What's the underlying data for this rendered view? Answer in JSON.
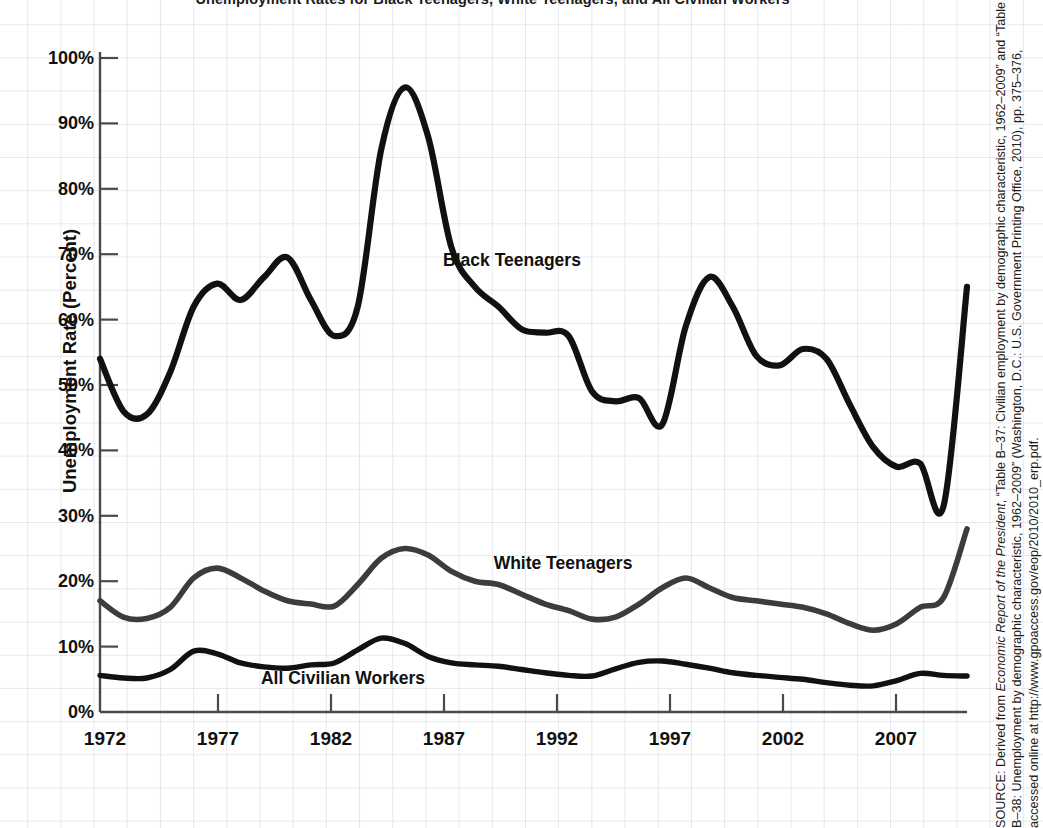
{
  "figure": {
    "title_cropped": "Unemployment Rates for Black Teenagers, White Teenagers, and All Civilian Workers",
    "source_prefix": "SOURCE: Derived from ",
    "source_italic_1": "Economic Report of the President",
    "source_mid_1": ", “Table B–37: Civilian employment by demographic characteristic, 1962–2009” and “Table B–38: Unemployment by demographic characteristic, 1962–2009” (Washington, D.C.: U.S. Government Printing Office, 2010), pp. 375–376, accessed online at http://www.gpoaccess.gov/eop/2010/2010_erp.pdf."
  },
  "axes": {
    "ylabel": "Unemployment Rate (Percent)",
    "xlabel": "",
    "yticks": [
      "0%",
      "10%",
      "20%",
      "30%",
      "40%",
      "50%",
      "60%",
      "70%",
      "80%",
      "90%",
      "100%"
    ],
    "xticks": [
      "1972",
      "1977",
      "1982",
      "1987",
      "1992",
      "1997",
      "2002",
      "2007"
    ]
  },
  "colors": {
    "black_series": "#111111",
    "gray_series": "#3c3c3c",
    "axis": "#4a4a4a",
    "grid": "#acb7c4",
    "text": "#111111"
  },
  "chart_data": {
    "type": "line",
    "title": "Unemployment Rates for Black Teenagers, White Teenagers, and All Civilian Workers",
    "xlabel": "",
    "ylabel": "Unemployment Rate (Percent)",
    "xlim": [
      1972,
      2009
    ],
    "ylim": [
      0,
      100
    ],
    "grid": true,
    "legend_position": "inline-labels",
    "x": [
      1972,
      1973,
      1974,
      1975,
      1976,
      1977,
      1978,
      1979,
      1980,
      1981,
      1982,
      1983,
      1984,
      1985,
      1986,
      1987,
      1988,
      1989,
      1990,
      1991,
      1992,
      1993,
      1994,
      1995,
      1996,
      1997,
      1998,
      1999,
      2000,
      2001,
      2002,
      2003,
      2004,
      2005,
      2006,
      2007,
      2008,
      2009
    ],
    "series": [
      {
        "name": "Black Teenagers",
        "color": "#111111",
        "label_year": 1990,
        "label_value": 72,
        "values": [
          54.0,
          46.0,
          45.5,
          52.0,
          62.0,
          65.5,
          63.0,
          66.5,
          69.5,
          63.0,
          57.5,
          62.0,
          86.0,
          95.5,
          88.0,
          71.0,
          65.0,
          62.0,
          58.5,
          58.0,
          57.5,
          49.0,
          47.5,
          48.0,
          44.0,
          59.0,
          66.5,
          62.0,
          54.5,
          53.0,
          55.5,
          54.0,
          47.0,
          40.5,
          37.5,
          38.0,
          31.5,
          65.0
        ]
      },
      {
        "name": "White Teenagers",
        "color": "#3c3c3c",
        "label_year": 1992,
        "label_value": 24.5,
        "values": [
          17.0,
          14.5,
          14.3,
          16.0,
          20.5,
          22.0,
          20.5,
          18.5,
          17.0,
          16.5,
          16.2,
          19.5,
          23.5,
          25.0,
          24.0,
          21.5,
          20.0,
          19.5,
          18.0,
          16.5,
          15.5,
          14.2,
          14.5,
          16.5,
          19.0,
          20.5,
          19.0,
          17.5,
          17.0,
          16.5,
          16.0,
          15.0,
          13.5,
          12.5,
          13.5,
          16.0,
          17.5,
          28.0
        ]
      },
      {
        "name": "All Civilian Workers",
        "color": "#111111",
        "label_year": 1982,
        "label_value": 3.2,
        "values": [
          5.6,
          5.2,
          5.2,
          6.5,
          9.3,
          8.9,
          7.5,
          6.9,
          6.7,
          7.2,
          7.5,
          9.5,
          11.3,
          10.5,
          8.5,
          7.5,
          7.2,
          7.0,
          6.5,
          6.0,
          5.6,
          5.5,
          6.6,
          7.6,
          7.8,
          7.3,
          6.7,
          6.0,
          5.6,
          5.3,
          5.0,
          4.5,
          4.1,
          4.0,
          4.8,
          5.9,
          5.6,
          5.5
        ]
      }
    ]
  }
}
